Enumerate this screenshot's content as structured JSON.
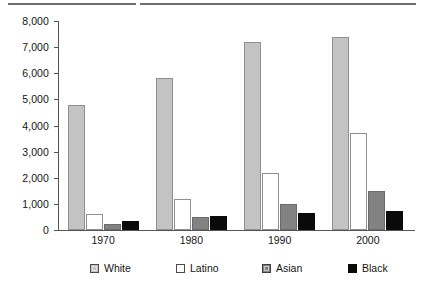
{
  "chart_data": {
    "type": "bar",
    "title": "",
    "xlabel": "",
    "ylabel": "",
    "categories": [
      "1970",
      "1980",
      "1990",
      "2000"
    ],
    "ylim": [
      0,
      8000
    ],
    "ytick_values": [
      0,
      1000,
      2000,
      3000,
      4000,
      5000,
      6000,
      7000,
      8000
    ],
    "ytick_labels": [
      "0",
      "1,000",
      "2,000",
      "3,000",
      "4,000",
      "5,000",
      "6,000",
      "7,000",
      "8,000"
    ],
    "grid": false,
    "legend_position": "bottom",
    "series": [
      {
        "name": "White",
        "color": "#c3c3c3",
        "values": [
          4800,
          5800,
          7200,
          7400
        ]
      },
      {
        "name": "Latino",
        "color": "#ffffff",
        "values": [
          600,
          1200,
          2200,
          3700
        ]
      },
      {
        "name": "Asian",
        "color": "#828282",
        "values": [
          220,
          500,
          1000,
          1500
        ]
      },
      {
        "name": "Black",
        "color": "#0a0a0a",
        "values": [
          350,
          550,
          650,
          730
        ]
      }
    ]
  },
  "legend": {
    "items": [
      {
        "label": "White",
        "swatch": "white"
      },
      {
        "label": "Latino",
        "swatch": "latino"
      },
      {
        "label": "Asian",
        "swatch": "asian"
      },
      {
        "label": "Black",
        "swatch": "black"
      }
    ]
  },
  "decor": {
    "top_rule_color": "#6e6e6e"
  }
}
